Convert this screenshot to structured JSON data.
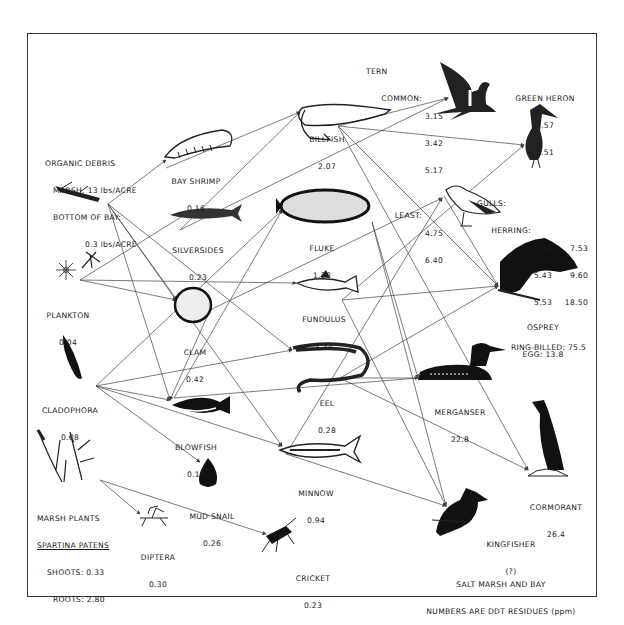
{
  "diagram": {
    "title": "SALT MARSH AND BAY",
    "subtitle": "NUMBERS ARE DDT RESIDUES (ppm)",
    "colors": {
      "ink": "#1a1a1a",
      "line": "#444444",
      "background": "#ffffff"
    },
    "nodes": {
      "organic_debris": {
        "name": "ORGANIC DEBRIS",
        "line1": "MARSH: 13 lbs/ACRE",
        "line2": "BOTTOM OF BAY:",
        "line3": "0.3 lbs/ACRE",
        "icon": "debris-icon"
      },
      "bay_shrimp": {
        "name": "BAY SHRIMP",
        "value": "0.16",
        "icon": "shrimp-icon"
      },
      "billfish": {
        "name": "BILLFISH",
        "value": "2.07",
        "icon": "billfish-icon"
      },
      "tern": {
        "name": "TERN",
        "common_label": "COMMON:",
        "common_values": [
          "3.15",
          "3.42",
          "5.17"
        ],
        "least_label": "LEAST:",
        "least_values": [
          "4.75",
          "6.40"
        ],
        "icon": "tern-icon"
      },
      "green_heron": {
        "name": "GREEN HERON",
        "values": [
          "3.57",
          "3.51"
        ],
        "icon": "heron-icon"
      },
      "silversides": {
        "name": "SILVERSIDES",
        "value": "0.23",
        "icon": "silversides-icon"
      },
      "fluke": {
        "name": "FLUKE",
        "value": "1.28",
        "icon": "fluke-icon"
      },
      "gulls": {
        "name": "GULLS:",
        "herring_label": "HERRING:",
        "herring_values": [
          [
            "3.52",
            "7.53"
          ],
          [
            "5.43",
            "9.60"
          ],
          [
            "5.53",
            "18.50"
          ]
        ],
        "ring_billed": "RING-BILLED: 75.5",
        "icon": "gull-icon"
      },
      "plankton": {
        "name": "PLANKTON",
        "value": "0.04",
        "icon": "plankton-icon"
      },
      "fundulus": {
        "name": "FUNDULUS",
        "value": "1.24",
        "icon": "fundulus-icon"
      },
      "osprey": {
        "name": "OSPREY",
        "value": "EGG: 13.8",
        "icon": "osprey-icon"
      },
      "clam": {
        "name": "CLAM",
        "value": "0.42",
        "icon": "clam-icon"
      },
      "cladophora": {
        "name": "CLADOPHORA",
        "value": "0.08",
        "icon": "cladophora-icon"
      },
      "eel": {
        "name": "EEL",
        "value": "0.28",
        "icon": "eel-icon"
      },
      "merganser": {
        "name": "MERGANSER",
        "value": "22.8",
        "icon": "merganser-icon"
      },
      "blowfish": {
        "name": "BLOWFISH",
        "value": "0.17",
        "icon": "blowfish-icon"
      },
      "minnow": {
        "name": "MINNOW",
        "value": "0.94",
        "icon": "minnow-icon"
      },
      "cormorant": {
        "name": "CORMORANT",
        "value": "26.4",
        "icon": "cormorant-icon"
      },
      "marsh_plants": {
        "name": "MARSH PLANTS",
        "species": "SPARTINA PATENS",
        "shoots": "SHOOTS: 0.33",
        "roots": "ROOTS: 2.80",
        "icon": "marsh-plants-icon"
      },
      "mud_snail": {
        "name": "MUD SNAIL",
        "value": "0.26",
        "icon": "snail-icon"
      },
      "diptera": {
        "name": "DIPTERA",
        "value": "0.30",
        "icon": "diptera-icon"
      },
      "cricket": {
        "name": "CRICKET",
        "value": "0.23",
        "icon": "cricket-icon"
      },
      "kingfisher": {
        "name": "KINGFISHER",
        "value": "(?)",
        "icon": "kingfisher-icon"
      }
    },
    "edges": [
      [
        "organic_debris",
        "bay_shrimp"
      ],
      [
        "organic_debris",
        "clam"
      ],
      [
        "organic_debris",
        "blowfish"
      ],
      [
        "organic_debris",
        "eel"
      ],
      [
        "organic_debris",
        "minnow"
      ],
      [
        "bay_shrimp",
        "billfish"
      ],
      [
        "silversides",
        "billfish"
      ],
      [
        "silversides",
        "tern"
      ],
      [
        "billfish",
        "tern"
      ],
      [
        "billfish",
        "green_heron"
      ],
      [
        "billfish",
        "osprey"
      ],
      [
        "plankton",
        "silversides"
      ],
      [
        "plankton",
        "clam"
      ],
      [
        "plankton",
        "fundulus"
      ],
      [
        "cladophora",
        "fluke"
      ],
      [
        "cladophora",
        "eel"
      ],
      [
        "cladophora",
        "blowfish"
      ],
      [
        "cladophora",
        "mud_snail"
      ],
      [
        "cladophora",
        "minnow"
      ],
      [
        "clam",
        "blowfish"
      ],
      [
        "clam",
        "gulls"
      ],
      [
        "fluke",
        "merganser"
      ],
      [
        "fluke",
        "kingfisher"
      ],
      [
        "fundulus",
        "osprey"
      ],
      [
        "fundulus",
        "green_heron"
      ],
      [
        "fundulus",
        "kingfisher"
      ],
      [
        "eel",
        "osprey"
      ],
      [
        "eel",
        "merganser"
      ],
      [
        "eel",
        "cormorant"
      ],
      [
        "blowfish",
        "fluke"
      ],
      [
        "blowfish",
        "merganser"
      ],
      [
        "minnow",
        "kingfisher"
      ],
      [
        "minnow",
        "gulls"
      ],
      [
        "gulls",
        "osprey"
      ],
      [
        "marsh_plants",
        "diptera"
      ],
      [
        "marsh_plants",
        "cricket"
      ],
      [
        "billfish",
        "cormorant"
      ]
    ]
  }
}
